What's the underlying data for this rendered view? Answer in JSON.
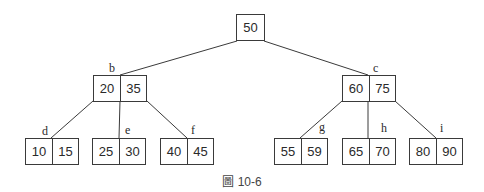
{
  "figure": {
    "caption_prefix_glyph": "圖",
    "caption_number": "10-6",
    "line_color": "#3a3a3a"
  },
  "tree": {
    "root": {
      "keys": [
        "50"
      ]
    },
    "b": {
      "label": "b",
      "keys": [
        "20",
        "35"
      ]
    },
    "c": {
      "label": "c",
      "keys": [
        "60",
        "75"
      ]
    },
    "d": {
      "label": "d",
      "keys": [
        "10",
        "15"
      ]
    },
    "e": {
      "label": "e",
      "keys": [
        "25",
        "30"
      ]
    },
    "f": {
      "label": "f",
      "keys": [
        "40",
        "45"
      ]
    },
    "g": {
      "label": "g",
      "keys": [
        "55",
        "59"
      ]
    },
    "h": {
      "label": "h",
      "keys": [
        "65",
        "70"
      ]
    },
    "i": {
      "label": "i",
      "keys": [
        "80",
        "90"
      ]
    }
  }
}
